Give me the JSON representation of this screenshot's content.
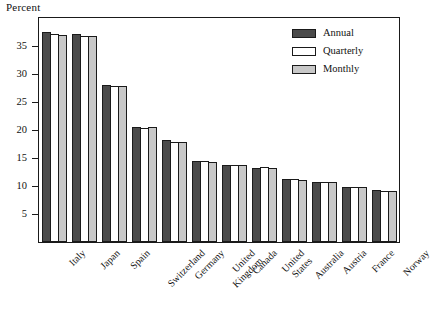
{
  "chart_data": {
    "type": "bar",
    "title": "Percent",
    "xlabel": "",
    "ylabel": "Percent",
    "ylim": [
      0,
      40
    ],
    "yticks": [
      5,
      10,
      15,
      20,
      25,
      30,
      35
    ],
    "grid": false,
    "legend_position": "top-right",
    "categories": [
      "Italy",
      "Japan",
      "Spain",
      "Switzerland",
      "Germany",
      "United Kingdom",
      "Canada",
      "United States",
      "Australia",
      "Austria",
      "France",
      "Norway"
    ],
    "series": [
      {
        "name": "Annual",
        "color": "#4a4a4a",
        "values": [
          37.5,
          37.1,
          28.1,
          20.6,
          18.2,
          14.5,
          13.8,
          13.3,
          11.2,
          10.8,
          9.9,
          9.2
        ]
      },
      {
        "name": "Quarterly",
        "color": "#ffffff",
        "values": [
          37.2,
          36.8,
          27.9,
          20.4,
          17.9,
          14.4,
          13.7,
          13.4,
          11.2,
          10.7,
          9.8,
          9.1
        ]
      },
      {
        "name": "Monthly",
        "color": "#c8c8c8",
        "values": [
          37.0,
          36.7,
          27.8,
          20.5,
          17.9,
          14.2,
          13.7,
          13.2,
          11.1,
          10.7,
          9.8,
          9.1
        ]
      }
    ]
  },
  "legend": {
    "items": [
      {
        "label": "Annual",
        "swatch": "annual"
      },
      {
        "label": "Quarterly",
        "swatch": "quarterly"
      },
      {
        "label": "Monthly",
        "swatch": "monthly"
      }
    ]
  }
}
